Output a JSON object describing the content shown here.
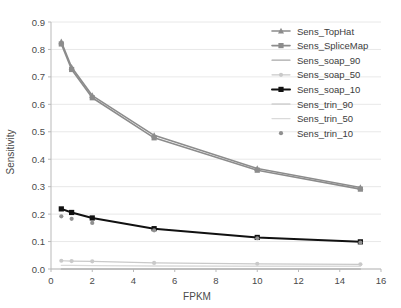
{
  "chart_data": {
    "type": "line",
    "title": "",
    "xlabel": "FPKM",
    "ylabel": "Sensitivity",
    "xlim": [
      0,
      16
    ],
    "ylim": [
      0.0,
      0.9
    ],
    "xticks": [
      "0",
      "2",
      "4",
      "6",
      "8",
      "10",
      "12",
      "14",
      "16"
    ],
    "xtick_values": [
      0,
      2,
      4,
      6,
      8,
      10,
      12,
      14,
      16
    ],
    "yticks": [
      "0.0",
      "0.1",
      "0.2",
      "0.3",
      "0.4",
      "0.5",
      "0.6",
      "0.7",
      "0.8",
      "0.9"
    ],
    "ytick_values": [
      0.0,
      0.1,
      0.2,
      0.3,
      0.4,
      0.5,
      0.6,
      0.7,
      0.8,
      0.9
    ],
    "grid": true,
    "legend_position": "upper right",
    "x": [
      0.5,
      1,
      2,
      5,
      10,
      15
    ],
    "series": [
      {
        "name": "Sens_TopHat",
        "values": [
          0.828,
          0.735,
          0.632,
          0.487,
          0.366,
          0.297
        ],
        "color": "#8c8c8c",
        "marker": "triangle",
        "width": 1.6
      },
      {
        "name": "Sens_SpliceMap",
        "values": [
          0.82,
          0.727,
          0.624,
          0.478,
          0.36,
          0.291
        ],
        "color": "#8c8c8c",
        "marker": "square",
        "width": 1.6
      },
      {
        "name": "Sens_soap_90",
        "values": [
          0.0,
          0.0,
          0.0,
          0.0,
          0.0,
          0.0
        ],
        "color": "#a8a8a8",
        "marker": "none",
        "width": 1.2
      },
      {
        "name": "Sens_soap_50",
        "values": [
          0.03,
          0.029,
          0.028,
          0.022,
          0.019,
          0.017
        ],
        "color": "#c9c9c9",
        "marker": "dot",
        "width": 1.2
      },
      {
        "name": "Sens_soap_10",
        "values": [
          0.219,
          0.206,
          0.186,
          0.147,
          0.115,
          0.099
        ],
        "color": "#111111",
        "marker": "square",
        "width": 2.0
      },
      {
        "name": "Sens_trin_90",
        "values": [
          0.0,
          0.0,
          0.0,
          0.0,
          0.0,
          0.0
        ],
        "color": "#bdbdbd",
        "marker": "none",
        "width": 1.1
      },
      {
        "name": "Sens_trin_50",
        "values": [
          0.013,
          0.013,
          0.012,
          0.011,
          0.01,
          0.01
        ],
        "color": "#dadada",
        "marker": "none",
        "width": 1.3
      },
      {
        "name": "Sens_trin_10",
        "values": [
          0.192,
          0.183,
          0.168,
          0.141,
          0.112,
          0.096
        ],
        "color": "#909090",
        "marker": "dot-only",
        "width": 0
      }
    ]
  },
  "legend": {
    "items": [
      {
        "label": "Sens_TopHat"
      },
      {
        "label": "Sens_SpliceMap"
      },
      {
        "label": "Sens_soap_90"
      },
      {
        "label": "Sens_soap_50"
      },
      {
        "label": "Sens_soap_10"
      },
      {
        "label": "Sens_trin_90"
      },
      {
        "label": "Sens_trin_50"
      },
      {
        "label": "Sens_trin_10"
      }
    ]
  }
}
